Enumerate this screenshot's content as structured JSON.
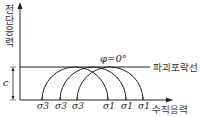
{
  "diagram": {
    "y_axis_label": "전단응력",
    "x_axis_label": "수직응력",
    "failure_line_label": "파괴포락선",
    "phi_label": "φ=0°",
    "cohesion_label": "c",
    "sigma3_labels": [
      "σ3",
      "σ3",
      "σ3"
    ],
    "sigma1_labels": [
      "σ1",
      "σ1",
      "σ1"
    ],
    "circles": [
      {
        "sigma3_x": 42,
        "sigma1_x": 108
      },
      {
        "sigma3_x": 60,
        "sigma1_x": 126
      },
      {
        "sigma3_x": 77,
        "sigma1_x": 143
      }
    ],
    "colors": {
      "line": "#222222",
      "text": "#333333"
    }
  }
}
